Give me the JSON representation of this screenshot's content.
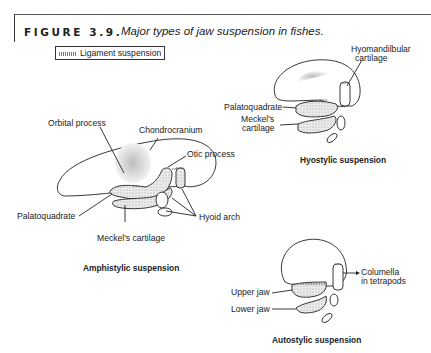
{
  "figure": {
    "label": "FIGURE 3.9.",
    "caption": "Major types of jaw suspension in fishes."
  },
  "legend": {
    "label": "Ligament suspension",
    "swatch": "hatched-ligament-marker"
  },
  "panels": {
    "amphistylic": {
      "title": "Amphistylic suspension",
      "labels": {
        "orbital_process": "Orbital process",
        "chondrocranium": "Chondrocranium",
        "otic_process": "Otic process",
        "palatoquadrate": "Palatoquadrate",
        "meckels_cartilage": "Meckel's cartilage",
        "hyoid_arch": "Hyoid arch"
      }
    },
    "hyostylic": {
      "title": "Hyostylic suspension",
      "labels": {
        "hyomandibular_line1": "Hyomandilbular",
        "hyomandibular_line2": "cartilage",
        "palatoquadrate": "Palatoquadrate",
        "meckels_line1": "Meckel's",
        "meckels_line2": "cartilage"
      }
    },
    "autostylic": {
      "title": "Autostylic suspension",
      "labels": {
        "columella_line1": "Columella",
        "columella_line2": "in tetrapods",
        "upper_jaw": "Upper jaw",
        "lower_jaw": "Lower jaw"
      }
    }
  },
  "colors": {
    "ink": "#222222",
    "stipple": "#cfcfcf",
    "background": "#ffffff"
  }
}
